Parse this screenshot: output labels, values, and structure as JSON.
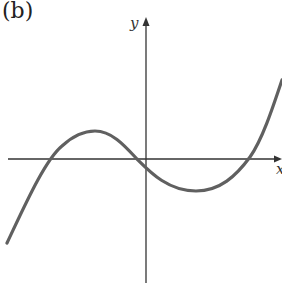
{
  "figure": {
    "panel_label": "(b)",
    "axes": {
      "x_label": "x",
      "y_label": "y"
    },
    "curve": {
      "description": "cubic curve with local maximum left of y-axis and local minimum right of y-axis",
      "color": "#606060",
      "x_intercepts": 3,
      "shape": "rises, local max, falls through y-axis below origin, local min, rises"
    },
    "colors": {
      "axes": "#333333",
      "curve": "#606060",
      "background": "#ffffff"
    }
  }
}
